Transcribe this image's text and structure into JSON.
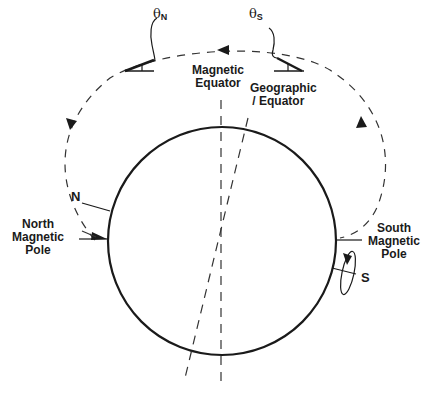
{
  "labels": {
    "theta_n": {
      "symbol": "θ",
      "subscript": "N"
    },
    "theta_s": {
      "symbol": "θ",
      "subscript": "S"
    },
    "magnetic_equator": [
      "Magnetic",
      "Equator"
    ],
    "geographic_equator": [
      "Geographic",
      "/ Equator"
    ],
    "north_marker": "N",
    "south_marker": "S",
    "north_magnetic_pole": [
      "North",
      "Magnetic",
      "Pole"
    ],
    "south_magnetic_pole": [
      "South",
      "Magnetic",
      "Pole"
    ]
  },
  "colors": {
    "ink": "#1a1a1a",
    "background": "#ffffff"
  },
  "geometry": {
    "earth_center": [
      222,
      242
    ],
    "earth_radius": 114
  }
}
